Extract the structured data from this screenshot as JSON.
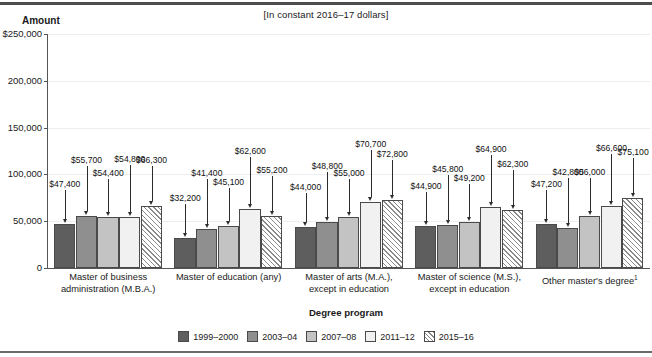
{
  "header": {
    "units_note": "[In constant 2016–17 dollars]",
    "y_axis_title": "Amount",
    "x_axis_title": "Degree program"
  },
  "chart_data": {
    "type": "bar",
    "title": "",
    "subtitle": "[In constant 2016–17 dollars]",
    "xlabel": "Degree program",
    "ylabel": "Amount",
    "ylim": [
      0,
      250000
    ],
    "ytick_values": [
      0,
      50000,
      100000,
      150000,
      200000,
      250000
    ],
    "ytick_labels": [
      "0",
      "50,000",
      "100,000",
      "150,000",
      "200,000",
      "$250,000"
    ],
    "grid": true,
    "legend_position": "bottom",
    "categories": [
      "Master of business administration (M.B.A.)",
      "Master of education (any)",
      "Master of arts (M.A.), except in education",
      "Master of science (M.S.), except in education",
      "Other master's degree"
    ],
    "category_lines": [
      [
        "Master of business",
        "administration (M.B.A.)"
      ],
      [
        "Master of education (any)"
      ],
      [
        "Master of arts (M.A.),",
        "except in education"
      ],
      [
        "Master of science (M.S.),",
        "except in education"
      ],
      [
        "Other master's degree"
      ]
    ],
    "category_footnotes": [
      "",
      "",
      "",
      "",
      "1"
    ],
    "series": [
      {
        "name": "1999–2000",
        "color": "#5e5e5e",
        "pattern": "solid",
        "values": [
          47400,
          32200,
          44000,
          44900,
          47200
        ],
        "labels": [
          "$47,400",
          "$32,200",
          "$44,000",
          "$44,900",
          "$47,200"
        ]
      },
      {
        "name": "2003–04",
        "color": "#8f8f8f",
        "pattern": "solid",
        "values": [
          55700,
          41400,
          48800,
          45800,
          42800
        ],
        "labels": [
          "$55,700",
          "$41,400",
          "$48,800",
          "$45,800",
          "$42,800"
        ]
      },
      {
        "name": "2007–08",
        "color": "#c3c3c3",
        "pattern": "solid",
        "values": [
          54400,
          45100,
          55000,
          49200,
          56000
        ],
        "labels": [
          "$54,400",
          "$45,100",
          "$55,000",
          "$49,200",
          "$56,000"
        ]
      },
      {
        "name": "2011–12",
        "color": "#f1f1f1",
        "pattern": "solid",
        "values": [
          54800,
          62600,
          70700,
          64900,
          66600
        ],
        "labels": [
          "$54,800",
          "$62,600",
          "$70,700",
          "$64,900",
          "$66,600"
        ]
      },
      {
        "name": "2015–16",
        "color": "#ffffff",
        "pattern": "diagonal-hatch",
        "values": [
          66300,
          55200,
          72800,
          62300,
          75100
        ],
        "labels": [
          "$66,300",
          "$55,200",
          "$72,800",
          "$62,300",
          "$75,100"
        ]
      }
    ]
  }
}
